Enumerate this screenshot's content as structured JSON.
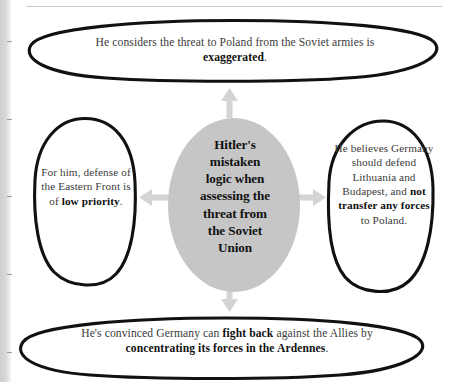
{
  "page": {
    "background_color": "#ffffff",
    "rule_color": "#c8c8c8",
    "edge_strip_color": "#d6d6d6"
  },
  "diagram": {
    "type": "concept-map",
    "layout": "central-node-with-four-satellites",
    "center_fill_color": "#c6c6c6",
    "outline_color": "#111111",
    "arrow_color": "#d4d4d4",
    "body_text_color": "#3a3a3a",
    "emphasis_text_color": "#111111",
    "center": {
      "id": "center-node",
      "shape": "ellipse-filled",
      "text_plain": "Hitler's mistaken logic when assessing the threat from the Soviet Union",
      "lines": [
        "Hitler's",
        "mistaken",
        "logic when",
        "assessing the",
        "threat from",
        "the Soviet",
        "Union"
      ]
    },
    "nodes": [
      {
        "id": "node-top",
        "position": "top",
        "shape": "ellipse-outline-wide",
        "text_plain": "He considers the threat to Poland from the Soviet armies is exaggerated.",
        "segments": [
          {
            "text": "He considers the threat to Poland from the Soviet armies is ",
            "bold": false
          },
          {
            "text": "exaggerated",
            "bold": true
          },
          {
            "text": ".",
            "bold": false
          }
        ]
      },
      {
        "id": "node-left",
        "position": "left",
        "shape": "ellipse-outline-tall",
        "text_plain": "For him, defense of the Eastern Front is of low priority.",
        "segments": [
          {
            "text": "For him, defense of the Eastern Front is of ",
            "bold": false
          },
          {
            "text": "low priority",
            "bold": true
          },
          {
            "text": ".",
            "bold": false
          }
        ]
      },
      {
        "id": "node-right",
        "position": "right",
        "shape": "ellipse-outline-tall",
        "text_plain": "He believes Germany should defend Lithuania and Budapest, and not transfer any forces to Poland.",
        "segments": [
          {
            "text": "He believes Germany should defend Lithuania and Budapest, and ",
            "bold": false
          },
          {
            "text": "not transfer any forces",
            "bold": true
          },
          {
            "text": " to Poland.",
            "bold": false
          }
        ]
      },
      {
        "id": "node-bottom",
        "position": "bottom",
        "shape": "ellipse-outline-wide",
        "text_plain": "He's convinced Germany can fight back against the Allies by concentrating its forces in the Ardennes.",
        "segments": [
          {
            "text": "He's convinced Germany can ",
            "bold": false
          },
          {
            "text": "fight back",
            "bold": true
          },
          {
            "text": " against the Allies by ",
            "bold": false
          },
          {
            "text": "concentrating its forces in the Ardennes",
            "bold": true
          },
          {
            "text": ".",
            "bold": false
          }
        ]
      }
    ],
    "arrows": [
      {
        "id": "arrow-up",
        "direction": "up",
        "from": "center-node",
        "to": "node-top"
      },
      {
        "id": "arrow-down",
        "direction": "down",
        "from": "center-node",
        "to": "node-bottom"
      },
      {
        "id": "arrow-left",
        "direction": "left",
        "from": "center-node",
        "to": "node-left"
      },
      {
        "id": "arrow-right",
        "direction": "right",
        "from": "center-node",
        "to": "node-right"
      }
    ]
  }
}
